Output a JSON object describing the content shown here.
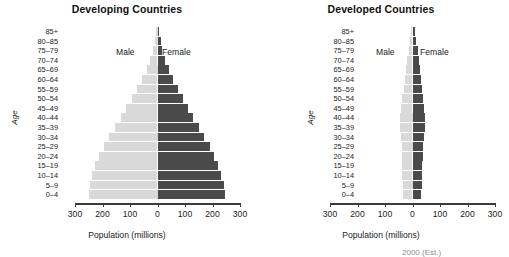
{
  "figure": {
    "axis_title_x": "Population (millions)",
    "axis_title_y": "Age",
    "series_male": "Male",
    "series_female": "Female",
    "color_male": "#d9d9d9",
    "color_female": "#4a4a4a",
    "footnote": "2000 (Est.)"
  },
  "chart_data": [
    {
      "type": "bar",
      "title": "Developing Countries",
      "xlabel": "Population (millions)",
      "ylabel": "Age",
      "orientation": "population-pyramid",
      "grid": false,
      "legend_position": "inside-top",
      "xlim": [
        -300,
        300
      ],
      "xticks": [
        300,
        200,
        100,
        0,
        100,
        200,
        300
      ],
      "categories": [
        "85+",
        "80–85",
        "75–79",
        "70–74",
        "65–69",
        "60–64",
        "55–59",
        "50–54",
        "45–49",
        "40–44",
        "35–39",
        "30–34",
        "25–29",
        "20–24",
        "15–19",
        "10–14",
        "5–9",
        "0–4"
      ],
      "series": [
        {
          "name": "Male",
          "values": [
            5,
            10,
            16,
            26,
            40,
            56,
            74,
            93,
            114,
            133,
            154,
            175,
            196,
            212,
            226,
            238,
            246,
            250
          ]
        },
        {
          "name": "Female",
          "values": [
            6,
            11,
            17,
            27,
            41,
            56,
            73,
            91,
            111,
            129,
            150,
            170,
            190,
            206,
            220,
            232,
            240,
            245
          ]
        }
      ]
    },
    {
      "type": "bar",
      "title": "Developed Countries",
      "xlabel": "Population (millions)",
      "ylabel": "Age",
      "orientation": "population-pyramid",
      "grid": false,
      "legend_position": "inside-top",
      "xlim": [
        -300,
        300
      ],
      "xticks": [
        300,
        200,
        100,
        0,
        100,
        200,
        300
      ],
      "categories": [
        "85+",
        "80–85",
        "75–79",
        "70–74",
        "65–69",
        "60–64",
        "55–59",
        "50–54",
        "45–49",
        "40–44",
        "35–39",
        "30–34",
        "25–29",
        "20–24",
        "15–19",
        "10–14",
        "5–9",
        "0–4"
      ],
      "series": [
        {
          "name": "Male",
          "values": [
            4,
            8,
            13,
            19,
            24,
            28,
            32,
            38,
            42,
            45,
            46,
            42,
            40,
            38,
            38,
            38,
            35,
            33
          ]
        },
        {
          "name": "Female",
          "values": [
            9,
            14,
            19,
            24,
            28,
            31,
            34,
            39,
            43,
            45,
            46,
            42,
            39,
            37,
            36,
            36,
            33,
            31
          ]
        }
      ]
    }
  ]
}
